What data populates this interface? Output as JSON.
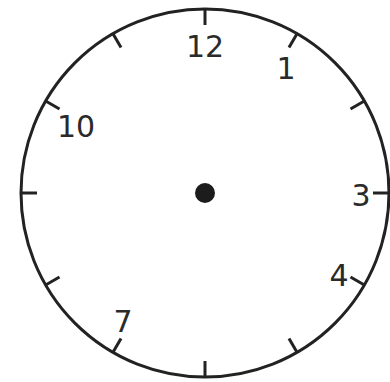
{
  "clock": {
    "center": [
      205,
      193
    ],
    "radius": 184,
    "stroke_color": "#222222",
    "hub_color": "#1c1c1c",
    "tick_length": 16,
    "ticks_at_hours": [
      1,
      2,
      3,
      4,
      5,
      6,
      7,
      8,
      9,
      10,
      11,
      12
    ],
    "numbers": [
      {
        "label": "12",
        "hour": 12,
        "x": 205,
        "y": 57
      },
      {
        "label": "1",
        "hour": 1,
        "x": 286,
        "y": 79
      },
      {
        "label": "3",
        "hour": 3,
        "x": 361,
        "y": 206
      },
      {
        "label": "4",
        "hour": 4,
        "x": 339,
        "y": 286
      },
      {
        "label": "7",
        "hour": 7,
        "x": 123,
        "y": 332
      },
      {
        "label": "10",
        "hour": 10,
        "x": 76,
        "y": 137
      }
    ],
    "missing_numbers": [
      "2",
      "5",
      "6",
      "8",
      "9",
      "11"
    ],
    "hands": "none"
  }
}
